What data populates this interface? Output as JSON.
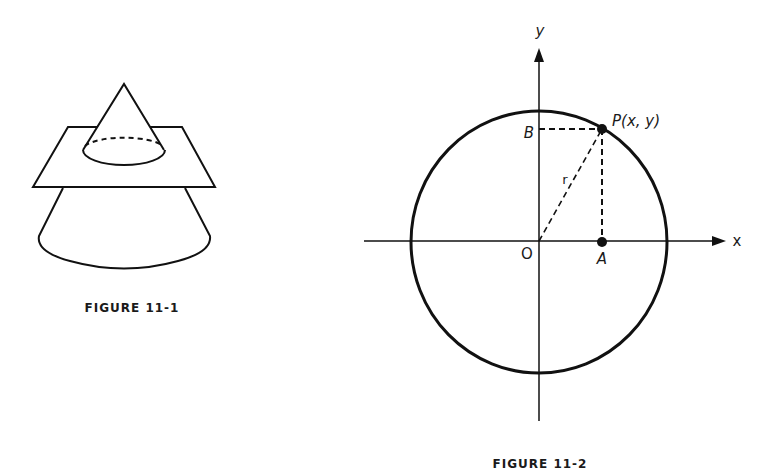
{
  "figures": [
    {
      "caption": "FIGURE 11-1",
      "description": "A cone intersected by a horizontal plane, cross-section ellipse with hidden dashed back edge"
    },
    {
      "caption": "FIGURE 11-2",
      "description": "Circle centered at origin with point P(x, y) on it, projections A on x-axis and B on y-axis, radius r",
      "labels": {
        "y_axis": "y",
        "x_axis": "x",
        "origin": "O",
        "point_p": "P(x, y)",
        "point_a": "A",
        "point_b": "B",
        "radius": "r"
      }
    }
  ],
  "colors": {
    "ink": "#111111",
    "background": "#ffffff"
  }
}
